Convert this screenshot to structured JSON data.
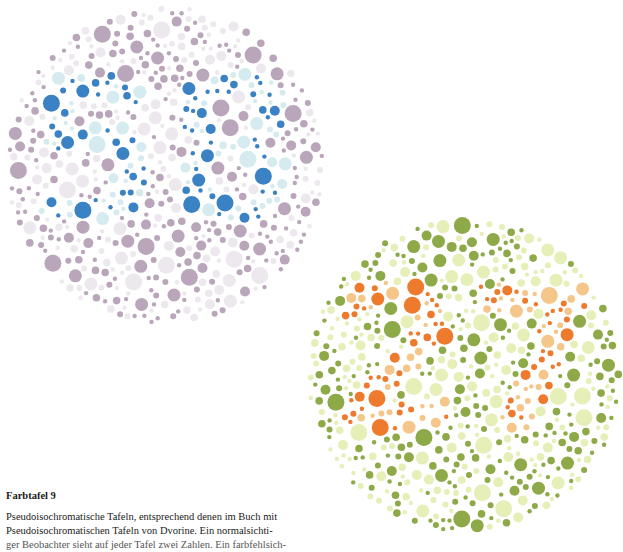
{
  "plates": [
    {
      "id": "plate-1",
      "label": "Pseudoisochromatic plate (blue/purple)",
      "hidden_figure": "58",
      "center": [
        165,
        165
      ],
      "radius": 160,
      "colors": {
        "background_major": "#b9a6ba",
        "background_minor": "#ede8ee",
        "figure_major": "#3b82c4",
        "figure_minor": "#d6ebef"
      }
    },
    {
      "id": "plate-2",
      "label": "Pseudoisochromatic plate (orange/green)",
      "hidden_figure": "27",
      "center": [
        160,
        170
      ],
      "radius": 158,
      "colors": {
        "background_major": "#8eaa48",
        "background_minor": "#e6efb8",
        "figure_major": "#ee7a2e",
        "figure_minor": "#f5c68a"
      }
    }
  ],
  "caption": {
    "title": "Farbtafel 9",
    "lines": [
      "Pseudoisochromatische Tafeln, entsprechend denen im Buch mit",
      "Pseudoisochromatischen Tafeln von Dvorine. Ein normalsichti-",
      "ger Beobachter sieht auf jeder Tafel zwei Zahlen. Ein farbfehlsich-"
    ]
  }
}
